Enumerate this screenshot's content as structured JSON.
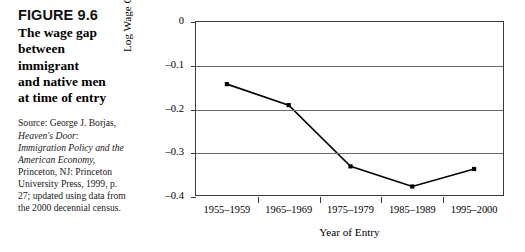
{
  "caption": {
    "figure_number": "FIGURE 9.6",
    "title_lines": [
      "The wage gap",
      "between",
      "immigrant",
      "and native men",
      "at time of entry"
    ],
    "source_prefix": "Source: George J. Borjas, ",
    "source_italic": "Heaven's Door: Immigration Policy and the American Economy,",
    "source_suffix": " Princeton, NJ: Princeton University Press, 1999, p. 27; updated using data from the 2000 decennial census."
  },
  "chart_data": {
    "type": "line",
    "title": "",
    "categories": [
      "1955–1959",
      "1965–1969",
      "1975–1979",
      "1985–1989",
      "1995–2000"
    ],
    "values": [
      -0.142,
      -0.19,
      -0.33,
      -0.376,
      -0.336
    ],
    "xlabel": "Year of Entry",
    "ylabel": "Log Wage Gap",
    "ylim": [
      -0.4,
      0
    ],
    "yticks": [
      0,
      -0.1,
      -0.2,
      -0.3,
      -0.4
    ],
    "ytick_labels": [
      "0",
      "–0.1",
      "–0.2",
      "–0.3",
      "–0.4"
    ],
    "grid": true,
    "legend": "none",
    "line_color": "#000000",
    "marker": "square",
    "marker_color": "#000000"
  }
}
